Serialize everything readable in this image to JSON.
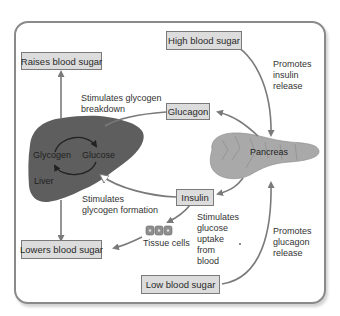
{
  "diagram": {
    "boxes": {
      "high_blood_sugar": "High blood sugar",
      "raises_blood_sugar": "Raises blood sugar",
      "glucagon": "Glucagon",
      "insulin": "Insulin",
      "lowers_blood_sugar": "Lowers blood sugar",
      "low_blood_sugar": "Low blood sugar"
    },
    "organs": {
      "liver": "Liver",
      "glycogen": "Glycogen",
      "glucose": "Glucose",
      "pancreas": "Pancreas",
      "tissue_cells": "Tissue cells"
    },
    "annotations": {
      "glycogen_breakdown_1": "Stimulates glycogen",
      "glycogen_breakdown_2": "breakdown",
      "promotes_insulin_1": "Promotes",
      "promotes_insulin_2": "insulin",
      "promotes_insulin_3": "release",
      "glycogen_formation_1": "Stimulates",
      "glycogen_formation_2": "glycogen formation",
      "glucose_uptake_1": "Stimulates",
      "glucose_uptake_2": "glucose",
      "glucose_uptake_3": "uptake",
      "glucose_uptake_4": "from",
      "glucose_uptake_5": "blood",
      "promotes_glucagon_1": "Promotes",
      "promotes_glucagon_2": "glucagon",
      "promotes_glucagon_3": "release"
    },
    "colors": {
      "frame": "#8a8a8a",
      "box_fill": "#dcdcdc",
      "arrow": "#7a7a7a",
      "liver": "#5e5e5e",
      "pancreas": "#a9a9a9"
    }
  }
}
